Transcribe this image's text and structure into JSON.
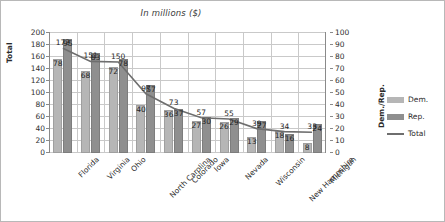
{
  "chart_data": {
    "type": "bar",
    "title": "In millions ($)",
    "xlabel": "",
    "ylabel": "Total",
    "ylabel_secondary": "Dem./Rep.",
    "ylim": [
      0,
      200
    ],
    "ylim_secondary": [
      0,
      100
    ],
    "yticks": [
      0,
      20,
      40,
      60,
      80,
      100,
      120,
      140,
      160,
      180,
      200
    ],
    "yticks_secondary": [
      0,
      10,
      20,
      30,
      40,
      50,
      60,
      70,
      80,
      90,
      100
    ],
    "grid": true,
    "legend_position": "right",
    "categories": [
      "Florida",
      "Virginia",
      "Ohio",
      "North Carolina",
      "Colorado",
      "Iowa",
      "Nevada",
      "Wisconsin",
      "New Hampshire",
      "Michigan"
    ],
    "series": [
      {
        "name": "Dem.",
        "type": "bar",
        "axis": "secondary",
        "color": "#b6b6b6",
        "values": [
          78,
          68,
          72,
          40,
          36,
          27,
          26,
          13,
          18,
          8
        ]
      },
      {
        "name": "Rep.",
        "type": "bar",
        "axis": "secondary",
        "color": "#8f8f8f",
        "values": [
          95,
          83,
          78,
          57,
          37,
          30,
          29,
          27,
          16,
          24
        ]
      },
      {
        "name": "Total",
        "type": "line",
        "axis": "primary",
        "color": "#6e6e6e",
        "values": [
          173,
          151,
          150,
          97,
          73,
          57,
          55,
          39,
          34,
          33
        ]
      }
    ]
  },
  "legend": {
    "items": [
      {
        "label": "Dem.",
        "marker": "swatch",
        "color": "#b6b6b6"
      },
      {
        "label": "Rep.",
        "marker": "swatch",
        "color": "#8f8f8f"
      },
      {
        "label": "Total",
        "marker": "line",
        "color": "#6e6e6e"
      }
    ]
  }
}
